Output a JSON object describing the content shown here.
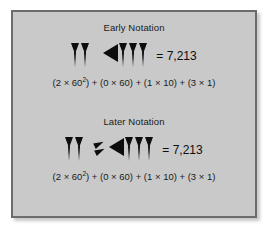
{
  "figure": {
    "background_color": "#c9c9c9",
    "border_color": "#6c6c6c",
    "panels": [
      {
        "title": "Early Notation",
        "glyphs": [
          {
            "type": "ones",
            "count": 2,
            "value": 2
          },
          {
            "type": "ten",
            "count": 1,
            "value": 10
          },
          {
            "type": "ones",
            "count": 3,
            "value": 3
          }
        ],
        "equals": "= 7,213",
        "formula_parts": {
          "p1_open": "(2 × 60",
          "p1_exp": "2",
          "p1_close": ") + ",
          "p2": "(0 × 60) + ",
          "p3": "(1 × 10) + ",
          "p4": "(3 × 1)"
        }
      },
      {
        "title": "Later Notation",
        "glyphs": [
          {
            "type": "ones",
            "count": 2,
            "value": 2
          },
          {
            "type": "zero",
            "count": 1,
            "value": 0
          },
          {
            "type": "ten",
            "count": 1,
            "value": 10
          },
          {
            "type": "ones",
            "count": 3,
            "value": 3
          }
        ],
        "equals": "= 7,213",
        "formula_parts": {
          "p1_open": "(2 × 60",
          "p1_exp": "2",
          "p1_close": ") + ",
          "p2": "(0 × 60) + ",
          "p3": "(1 × 10) + ",
          "p4": "(3 × 1)"
        }
      }
    ]
  }
}
